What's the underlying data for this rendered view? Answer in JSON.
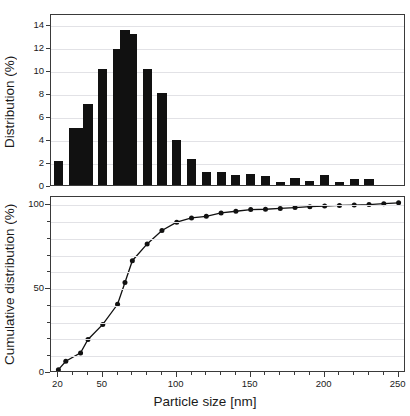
{
  "figure": {
    "xaxis_title": "Particle size [nm]",
    "panels": [
      {
        "id": "distribution",
        "ylabel": "Distribution (%)"
      },
      {
        "id": "cumulative",
        "ylabel": "Cumulative distribution (%)"
      }
    ]
  },
  "chart_data": [
    {
      "type": "bar",
      "title": "",
      "xlabel": "Particle size [nm]",
      "ylabel": "Distribution (%)",
      "xlim": [
        15,
        255
      ],
      "ylim": [
        0,
        15
      ],
      "yticks": [
        0,
        2,
        4,
        6,
        8,
        10,
        12,
        14
      ],
      "ytick_labels": [
        "0",
        "2",
        "4",
        "6",
        "8",
        "10",
        "12",
        "14"
      ],
      "grid": true,
      "legend": "none",
      "bar_color": "#111111",
      "categories": [
        20,
        30,
        35,
        40,
        50,
        60,
        65,
        70,
        80,
        90,
        100,
        110,
        120,
        130,
        140,
        150,
        160,
        170,
        180,
        190,
        200,
        210,
        220,
        230,
        240,
        250
      ],
      "x": [
        20,
        30,
        35,
        40,
        50,
        60,
        65,
        70,
        80,
        90,
        100,
        110,
        120,
        130,
        140,
        150,
        160,
        170,
        180,
        190,
        200,
        210,
        220,
        230,
        240,
        250
      ],
      "values": [
        2.1,
        5.0,
        5.0,
        7.1,
        10.1,
        11.9,
        13.5,
        13.2,
        10.1,
        8.0,
        3.9,
        2.3,
        1.1,
        1.1,
        0.85,
        0.95,
        0.75,
        0.25,
        0.6,
        0.35,
        0.85,
        0.25,
        0.55,
        0.5,
        0.0,
        0.0
      ]
    },
    {
      "type": "line",
      "title": "",
      "xlabel": "Particle size [nm]",
      "ylabel": "Cumulative distribution (%)",
      "xlim": [
        15,
        255
      ],
      "ylim": [
        0,
        105
      ],
      "yticks": [
        0,
        50,
        100
      ],
      "ytick_labels": [
        "0",
        "50",
        "100"
      ],
      "yminor_ticks": [
        10,
        20,
        30,
        40,
        60,
        70,
        80,
        90
      ],
      "xticks": [
        20,
        50,
        100,
        150,
        200,
        250
      ],
      "xtick_labels": [
        "20",
        "50",
        "100",
        "150",
        "200",
        "250"
      ],
      "xminor_ticks": [
        30,
        40,
        60,
        70,
        80,
        90,
        110,
        120,
        130,
        140,
        160,
        170,
        180,
        190,
        210,
        220,
        230,
        240
      ],
      "grid": true,
      "legend": "none",
      "line_color": "#111111",
      "marker": "circle",
      "marker_color": "#111111",
      "x": [
        20,
        25,
        35,
        40,
        50,
        60,
        65,
        70,
        80,
        90,
        100,
        110,
        120,
        130,
        140,
        150,
        160,
        170,
        180,
        190,
        200,
        210,
        220,
        230,
        240,
        250
      ],
      "y": [
        2,
        7,
        12,
        20,
        29,
        41,
        54,
        67,
        77,
        85,
        90,
        92.5,
        93.5,
        95.5,
        96.5,
        97.5,
        97.7,
        98.2,
        98.7,
        99.2,
        99.6,
        100,
        100.2,
        100.5,
        101,
        101.5
      ]
    }
  ]
}
